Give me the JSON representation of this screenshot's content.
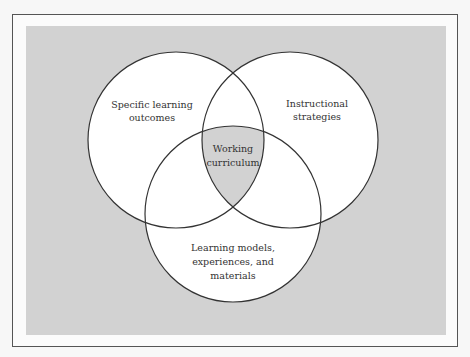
{
  "figure": {
    "colors": {
      "background_panel": "#d2d2d2",
      "circle_fill": "#ffffff",
      "center_fill": "#d2d2d2",
      "stroke": "#333333",
      "frame_border": "#555555"
    },
    "circles": [
      {
        "id": "outcomes",
        "lines": [
          "Specific learning",
          "outcomes"
        ],
        "cx": 176,
        "cy": 140,
        "r": 88
      },
      {
        "id": "strategies",
        "lines": [
          "Instructional",
          "strategies"
        ],
        "cx": 290,
        "cy": 140,
        "r": 88
      },
      {
        "id": "models",
        "lines": [
          "Learning models,",
          "experiences, and",
          "materials"
        ],
        "cx": 233,
        "cy": 214,
        "r": 88
      }
    ],
    "center": {
      "lines": [
        "Working",
        "curriculum"
      ]
    }
  }
}
